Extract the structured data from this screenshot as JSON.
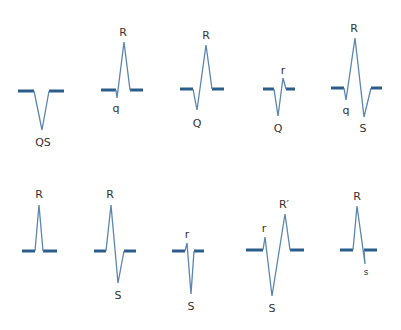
{
  "colors": {
    "baseline": "#2a5d8a",
    "waveform": "#5a86b0",
    "label": "#333333",
    "background": "#ffffff"
  },
  "complexes": [
    {
      "id": "qs",
      "row": 1,
      "name": "QS complex",
      "baseline_left": [
        [
          18,
          91
        ],
        [
          34,
          91
        ]
      ],
      "baseline_right": [
        [
          49,
          91
        ],
        [
          64,
          91
        ]
      ],
      "path": [
        [
          34,
          91
        ],
        [
          42,
          130
        ],
        [
          49,
          91
        ]
      ],
      "labels": [
        {
          "text": "QS",
          "x": 43,
          "y": 146,
          "size": "normal"
        }
      ]
    },
    {
      "id": "qR",
      "row": 1,
      "name": "qR complex",
      "baseline_left": [
        [
          101,
          90
        ],
        [
          116,
          90
        ]
      ],
      "baseline_right": [
        [
          130,
          90
        ],
        [
          143,
          90
        ]
      ],
      "path": [
        [
          116,
          90
        ],
        [
          117,
          98
        ],
        [
          124,
          42
        ],
        [
          130,
          90
        ]
      ],
      "labels": [
        {
          "text": "R",
          "x": 123,
          "y": 36,
          "size": "normal"
        },
        {
          "text": "q",
          "x": 116,
          "y": 112,
          "size": "normal"
        }
      ]
    },
    {
      "id": "QR",
      "row": 1,
      "name": "QR complex",
      "baseline_left": [
        [
          180,
          89
        ],
        [
          193,
          89
        ]
      ],
      "baseline_right": [
        [
          212,
          89
        ],
        [
          224,
          89
        ]
      ],
      "path": [
        [
          193,
          89
        ],
        [
          197,
          110
        ],
        [
          206,
          45
        ],
        [
          212,
          89
        ]
      ],
      "labels": [
        {
          "text": "R",
          "x": 206,
          "y": 39,
          "size": "normal"
        },
        {
          "text": "Q",
          "x": 197,
          "y": 127,
          "size": "normal"
        }
      ]
    },
    {
      "id": "Qr",
      "row": 1,
      "name": "Qr complex",
      "baseline_left": [
        [
          263,
          89
        ],
        [
          274,
          89
        ]
      ],
      "baseline_right": [
        [
          286,
          89
        ],
        [
          295,
          89
        ]
      ],
      "path": [
        [
          274,
          89
        ],
        [
          278,
          116
        ],
        [
          283,
          78
        ],
        [
          286,
          89
        ]
      ],
      "labels": [
        {
          "text": "r",
          "x": 283,
          "y": 74,
          "size": "normal"
        },
        {
          "text": "Q",
          "x": 278,
          "y": 132,
          "size": "normal"
        }
      ]
    },
    {
      "id": "qRS",
      "row": 1,
      "name": "qRS complex",
      "baseline_left": [
        [
          331,
          88
        ],
        [
          344,
          88
        ]
      ],
      "baseline_right": [
        [
          371,
          88
        ],
        [
          382,
          88
        ]
      ],
      "path": [
        [
          344,
          88
        ],
        [
          346,
          100
        ],
        [
          355,
          38
        ],
        [
          364,
          117
        ],
        [
          371,
          88
        ]
      ],
      "labels": [
        {
          "text": "R",
          "x": 354,
          "y": 32,
          "size": "normal"
        },
        {
          "text": "q",
          "x": 346,
          "y": 114,
          "size": "normal"
        },
        {
          "text": "S",
          "x": 363,
          "y": 132,
          "size": "normal"
        }
      ]
    },
    {
      "id": "R",
      "row": 2,
      "name": "R complex",
      "baseline_left": [
        [
          22,
          251
        ],
        [
          35,
          251
        ]
      ],
      "baseline_right": [
        [
          43,
          251
        ],
        [
          57,
          251
        ]
      ],
      "path": [
        [
          35,
          251
        ],
        [
          39,
          205
        ],
        [
          43,
          251
        ]
      ],
      "labels": [
        {
          "text": "R",
          "x": 39,
          "y": 198,
          "size": "normal"
        }
      ]
    },
    {
      "id": "RS",
      "row": 2,
      "name": "RS complex",
      "baseline_left": [
        [
          94,
          251
        ],
        [
          106,
          251
        ]
      ],
      "baseline_right": [
        [
          124,
          251
        ],
        [
          136,
          251
        ]
      ],
      "path": [
        [
          106,
          251
        ],
        [
          111,
          205
        ],
        [
          118,
          283
        ],
        [
          124,
          251
        ]
      ],
      "labels": [
        {
          "text": "R",
          "x": 110,
          "y": 198,
          "size": "normal"
        },
        {
          "text": "S",
          "x": 118,
          "y": 299,
          "size": "normal"
        }
      ]
    },
    {
      "id": "rS",
      "row": 2,
      "name": "rS complex",
      "baseline_left": [
        [
          172,
          251
        ],
        [
          185,
          251
        ]
      ],
      "baseline_right": [
        [
          194,
          251
        ],
        [
          204,
          251
        ]
      ],
      "path": [
        [
          185,
          251
        ],
        [
          187,
          243
        ],
        [
          191,
          294
        ],
        [
          194,
          251
        ]
      ],
      "labels": [
        {
          "text": "r",
          "x": 187,
          "y": 238,
          "size": "normal"
        },
        {
          "text": "S",
          "x": 191,
          "y": 310,
          "size": "normal"
        }
      ]
    },
    {
      "id": "rSR",
      "row": 2,
      "name": "rSR' complex",
      "baseline_left": [
        [
          246,
          250
        ],
        [
          263,
          250
        ]
      ],
      "baseline_right": [
        [
          290,
          250
        ],
        [
          304,
          250
        ]
      ],
      "path": [
        [
          263,
          250
        ],
        [
          265,
          237
        ],
        [
          272,
          296
        ],
        [
          285,
          214
        ],
        [
          290,
          250
        ]
      ],
      "labels": [
        {
          "text": "r",
          "x": 264,
          "y": 232,
          "size": "normal"
        },
        {
          "text": "R′",
          "x": 284,
          "y": 208,
          "size": "normal"
        },
        {
          "text": "S",
          "x": 272,
          "y": 312,
          "size": "normal"
        }
      ]
    },
    {
      "id": "Rs",
      "row": 2,
      "name": "Rs complex",
      "baseline_left": [
        [
          340,
          250
        ],
        [
          353,
          250
        ]
      ],
      "baseline_right": [
        [
          364,
          250
        ],
        [
          377,
          250
        ]
      ],
      "path": [
        [
          353,
          250
        ],
        [
          357,
          206
        ],
        [
          365,
          264
        ],
        [
          364,
          250
        ]
      ],
      "labels": [
        {
          "text": "R",
          "x": 357,
          "y": 200,
          "size": "normal"
        },
        {
          "text": "s",
          "x": 366,
          "y": 275,
          "size": "small"
        }
      ]
    }
  ]
}
